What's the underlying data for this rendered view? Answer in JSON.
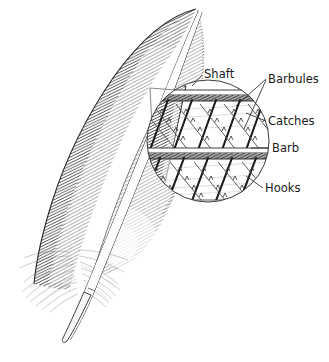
{
  "figure": {
    "background_color": "#ffffff",
    "ink_color": "#1a1a1a",
    "width": 329,
    "height": 362
  },
  "labels": [
    {
      "id": "shaft",
      "text": "Shaft",
      "text_x": 204,
      "text_y": 78,
      "anchor": "start",
      "leader": [
        [
          202,
          75
        ],
        [
          192,
          86
        ]
      ],
      "points_to": "rachis-dark-edge"
    },
    {
      "id": "barbules",
      "text": "Barbules",
      "text_x": 268,
      "text_y": 83,
      "anchor": "start",
      "leader": [
        [
          266,
          79
        ],
        [
          236,
          106
        ]
      ],
      "leader2": [
        [
          266,
          80
        ],
        [
          244,
          129
        ]
      ],
      "points_to": "diagonal-barbules-lattice"
    },
    {
      "id": "catches",
      "text": "Catches",
      "text_x": 268,
      "text_y": 125,
      "anchor": "start",
      "leader": [
        [
          266,
          121
        ],
        [
          246,
          113
        ]
      ],
      "points_to": "barbule-catch-ridges"
    },
    {
      "id": "barb",
      "text": "Barb",
      "text_x": 272,
      "text_y": 152,
      "anchor": "start",
      "leader": [
        [
          269,
          148
        ],
        [
          252,
          148
        ]
      ],
      "points_to": "horizontal-barb-shaft"
    },
    {
      "id": "hooks",
      "text": "Hooks",
      "text_x": 265,
      "text_y": 192,
      "anchor": "start",
      "leader": [
        [
          263,
          188
        ],
        [
          246,
          176
        ]
      ],
      "points_to": "barbule-hooklets"
    }
  ],
  "magnifier": {
    "center_x": 208,
    "center_y": 141,
    "radius": 62,
    "barb_shafts": [
      {
        "y": 96,
        "label": "upper-barb"
      },
      {
        "y": 154,
        "label": "lower-barb"
      }
    ]
  },
  "feather": {
    "parts": [
      "vane",
      "rachis",
      "calamus",
      "downy-barbs",
      "tip"
    ],
    "tip_x": 196,
    "tip_y": 8,
    "quill_tip_x": 63,
    "quill_tip_y": 338
  }
}
